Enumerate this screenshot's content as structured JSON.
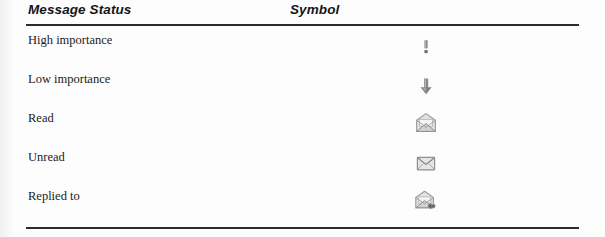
{
  "table": {
    "headers": {
      "status": "Message Status",
      "symbol": "Symbol"
    },
    "rows": [
      {
        "label": "High importance",
        "icon": "exclamation-mark-icon"
      },
      {
        "label": "Low importance",
        "icon": "down-arrow-icon"
      },
      {
        "label": "Read",
        "icon": "open-envelope-icon"
      },
      {
        "label": "Unread",
        "icon": "closed-envelope-icon"
      },
      {
        "label": "Replied to",
        "icon": "envelope-reply-arrow-icon"
      }
    ]
  },
  "colors": {
    "rule": "#2b2b2b",
    "text": "#1b1b1b",
    "header_text": "#151515",
    "icon_grey": "#8c8c8c",
    "icon_light": "#d6d6d6",
    "icon_dark": "#6f6f6f",
    "page_background": "#fdfdfd"
  }
}
